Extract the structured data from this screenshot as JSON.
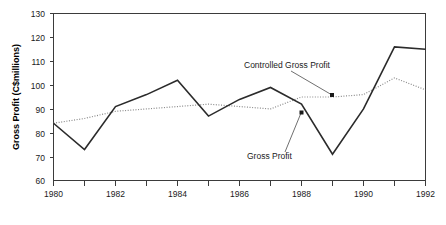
{
  "chart_data": {
    "type": "line",
    "title": "",
    "xlabel": "",
    "ylabel": "Gross Profit (C$millions)",
    "xlim": [
      1980,
      1992
    ],
    "ylim": [
      60,
      130
    ],
    "grid": false,
    "legend_position": "annotations-inline",
    "x": [
      1980,
      1981,
      1982,
      1983,
      1984,
      1985,
      1986,
      1987,
      1988,
      1989,
      1990,
      1991,
      1992
    ],
    "x_tick_labels": [
      "1980",
      "1982",
      "1984",
      "1986",
      "1988",
      "1990",
      "1992"
    ],
    "x_tick_values": [
      1980,
      1982,
      1984,
      1986,
      1988,
      1990,
      1992
    ],
    "x_minor_tick_values": [
      1981,
      1983,
      1985,
      1987,
      1989,
      1991
    ],
    "y_tick_labels": [
      "130",
      "120",
      "110",
      "100",
      "90",
      "80",
      "70",
      "60"
    ],
    "y_tick_values": [
      130,
      120,
      110,
      100,
      90,
      80,
      70,
      60
    ],
    "series": [
      {
        "name": "Gross Profit",
        "style": "solid",
        "color": "#2b2b2b",
        "values": [
          84,
          73,
          91,
          96,
          102,
          87,
          94,
          99,
          92,
          71,
          90,
          116,
          115
        ]
      },
      {
        "name": "Controlled Gross Profit",
        "style": "dotted",
        "color": "#8a8a8a",
        "values": [
          84,
          86,
          89,
          90,
          91,
          92,
          91,
          90,
          95,
          95,
          96,
          103,
          98
        ]
      }
    ],
    "annotations": [
      {
        "label": "Controlled Gross Profit",
        "target_x": 1989,
        "target_y": 95
      },
      {
        "label": "Gross Profit",
        "target_x": 1988,
        "target_y": 92
      }
    ]
  }
}
